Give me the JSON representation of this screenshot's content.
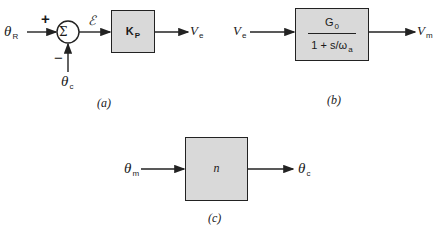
{
  "diagram_a": {
    "input": {
      "sym": "θ",
      "sub": "R"
    },
    "plus": "+",
    "minus": "−",
    "sum": "Σ",
    "error": "ℰ",
    "block": {
      "main": "K",
      "sub": "P"
    },
    "output": {
      "sym": "V",
      "sub": "e"
    },
    "feedback": {
      "sym": "θ",
      "sub": "c"
    },
    "caption": "(a)"
  },
  "diagram_b": {
    "input": {
      "sym": "V",
      "sub": "e"
    },
    "numerator": {
      "main": "G",
      "sub": "0"
    },
    "denominator": {
      "pre": "1 + s/ω",
      "sub": "a"
    },
    "output": {
      "sym": "V",
      "sub": "m"
    },
    "caption": "(b)"
  },
  "diagram_c": {
    "input": {
      "sym": "θ",
      "sub": "m"
    },
    "block": "n",
    "output": {
      "sym": "θ",
      "sub": "c"
    },
    "caption": "(c)"
  },
  "colors": {
    "block_fill": "#d9d9d9",
    "line": "#222222"
  }
}
